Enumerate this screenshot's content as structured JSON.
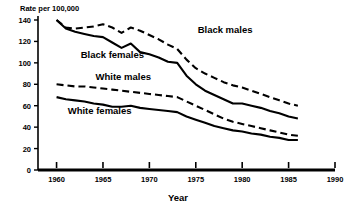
{
  "chart_data": {
    "type": "line",
    "title": "",
    "ylabel": "Rate per 100,000",
    "xlabel": "Year",
    "xlim": [
      1958,
      1990
    ],
    "ylim": [
      0,
      140
    ],
    "yticks": [
      0,
      20,
      40,
      60,
      80,
      100,
      120,
      140
    ],
    "xticks": [
      1960,
      1965,
      1970,
      1975,
      1980,
      1985,
      1990
    ],
    "grid": false,
    "legend_position": "inline-annotations",
    "series": [
      {
        "name": "Black males",
        "style": "dashed",
        "color": "#000000",
        "label_x": 1975.2,
        "label_y": 128,
        "x": [
          1960,
          1961,
          1962,
          1963,
          1964,
          1965,
          1966,
          1967,
          1968,
          1969,
          1970,
          1971,
          1972,
          1973,
          1974,
          1975,
          1976,
          1977,
          1978,
          1979,
          1980,
          1981,
          1982,
          1983,
          1984,
          1985,
          1986
        ],
        "values": [
          140,
          133,
          132,
          133,
          134,
          136,
          133,
          128,
          133,
          130,
          126,
          122,
          117,
          113,
          103,
          95,
          90,
          86,
          82,
          79,
          77,
          74,
          71,
          68,
          65,
          62,
          60
        ]
      },
      {
        "name": "Black females",
        "style": "solid",
        "color": "#000000",
        "label_x": 1962.6,
        "label_y": 105,
        "x": [
          1960,
          1961,
          1962,
          1963,
          1964,
          1965,
          1966,
          1967,
          1968,
          1969,
          1970,
          1971,
          1972,
          1973,
          1974,
          1975,
          1976,
          1977,
          1978,
          1979,
          1980,
          1981,
          1982,
          1983,
          1984,
          1985,
          1986
        ],
        "values": [
          140,
          132,
          129,
          127,
          125,
          124,
          119,
          114,
          118,
          110,
          108,
          105,
          101,
          100,
          88,
          80,
          74,
          70,
          66,
          62,
          62,
          60,
          58,
          55,
          53,
          50,
          48
        ]
      },
      {
        "name": "White males",
        "style": "dashed",
        "color": "#000000",
        "label_x": 1964.2,
        "label_y": 84,
        "x": [
          1960,
          1961,
          1962,
          1963,
          1964,
          1965,
          1966,
          1967,
          1968,
          1969,
          1970,
          1971,
          1972,
          1973,
          1974,
          1975,
          1976,
          1977,
          1978,
          1979,
          1980,
          1981,
          1982,
          1983,
          1984,
          1985,
          1986
        ],
        "values": [
          80,
          79,
          78,
          78,
          77,
          76,
          75,
          74,
          73,
          72,
          71,
          70,
          69,
          68,
          64,
          60,
          56,
          52,
          48,
          45,
          43,
          41,
          39,
          37,
          35,
          33,
          32
        ]
      },
      {
        "name": "White females",
        "style": "solid",
        "color": "#000000",
        "label_x": 1961.2,
        "label_y": 52,
        "x": [
          1960,
          1961,
          1962,
          1963,
          1964,
          1965,
          1966,
          1967,
          1968,
          1969,
          1970,
          1971,
          1972,
          1973,
          1974,
          1975,
          1976,
          1977,
          1978,
          1979,
          1980,
          1981,
          1982,
          1983,
          1984,
          1985,
          1986
        ],
        "values": [
          68,
          66,
          65,
          64,
          62,
          61,
          59,
          59,
          60,
          58,
          57,
          56,
          55,
          54,
          50,
          47,
          44,
          41,
          39,
          37,
          36,
          34,
          33,
          31,
          30,
          28,
          28
        ]
      }
    ]
  }
}
